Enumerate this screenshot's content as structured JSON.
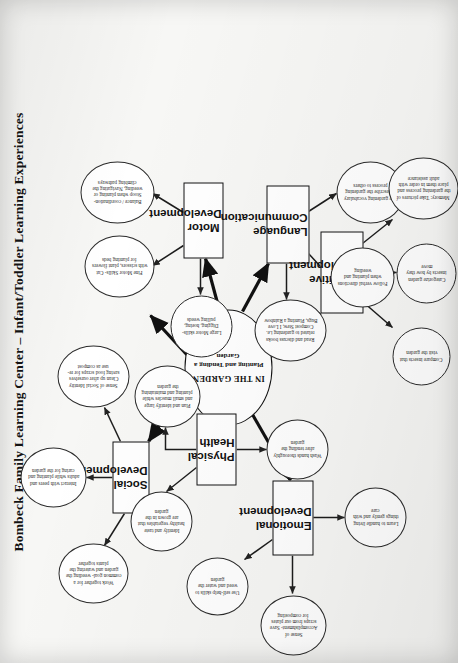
{
  "title": "Bombeck Family Learning Center – Infant/Toddler Learning Experiences",
  "center": {
    "line1": "IN THE GARDEN",
    "line2": "Planting and Tending a Garden"
  },
  "categories": [
    {
      "id": "social",
      "label": "Social Development"
    },
    {
      "id": "physical",
      "label": "Physical Health"
    },
    {
      "id": "motor",
      "label": "Motor Development"
    },
    {
      "id": "language",
      "label": "Language Communication"
    },
    {
      "id": "cognitive",
      "label": "Cognitive Development"
    },
    {
      "id": "emotional",
      "label": "Emotional Development"
    }
  ],
  "leaves": [
    {
      "id": "soc1",
      "parent": "social",
      "text": "Work together for a common goal- weeding the garden and watering the plants together"
    },
    {
      "id": "soc2",
      "parent": "social",
      "text": "Interact with peers and adults while planting and caring for the garden"
    },
    {
      "id": "soc3",
      "parent": "social",
      "text": "Sense of Social Identity Clean up after ourselves saving food scraps for re-use as compost"
    },
    {
      "id": "phy1",
      "parent": "physical",
      "text": "Identify and taste healthy vegetables that are grown in the garden"
    },
    {
      "id": "phy2",
      "parent": "physical",
      "text": "Plan and identify large and small muscles while planting and maintaining the garden"
    },
    {
      "id": "phy3",
      "parent": "physical",
      "text": "Wash hands thoroughly after tending the garden"
    },
    {
      "id": "mot1",
      "parent": "motor",
      "text": "Fine Motor Skills- Cut with scissors, plant flowers for planting beds"
    },
    {
      "id": "mot2",
      "parent": "motor",
      "text": "Balance / coordination- Stoop when planting or weeding, Navigating the climbing pathways"
    },
    {
      "id": "mot3",
      "parent": "motor",
      "text": "Large Motor skills- Digging, hoeing, pulling weeds"
    },
    {
      "id": "lan1",
      "parent": "language",
      "text": "Read and discuss books related to gardening i.e. Compost Stew, I Love Bugs, Planting a Rainbow"
    },
    {
      "id": "lan2",
      "parent": "language",
      "text": "Follow verbal directions when planting and weeding"
    },
    {
      "id": "lan3",
      "parent": "language",
      "text": "Use gardening vocabulary to describe the gardening process to others"
    },
    {
      "id": "cog1",
      "parent": "cognitive",
      "text": "Compare insects that visit the garden"
    },
    {
      "id": "cog2",
      "parent": "cognitive",
      "text": "Categorize garden insects by how they move"
    },
    {
      "id": "cog3",
      "parent": "cognitive",
      "text": "Memory: Take pictures of the gardening process and place them in order with adult assistance"
    },
    {
      "id": "emo1",
      "parent": "emotional",
      "text": "Use self-help skills to weed and water the garden"
    },
    {
      "id": "emo2",
      "parent": "emotional",
      "text": "Sense of Accomplishment- Save scraps from our plates for composting"
    },
    {
      "id": "emo3",
      "parent": "emotional",
      "text": "Learn to handle living things gently and with care"
    }
  ],
  "colors": {
    "paper": "#f7f7f5",
    "ink": "#111111",
    "leaf_ink": "#2a2a2a"
  }
}
